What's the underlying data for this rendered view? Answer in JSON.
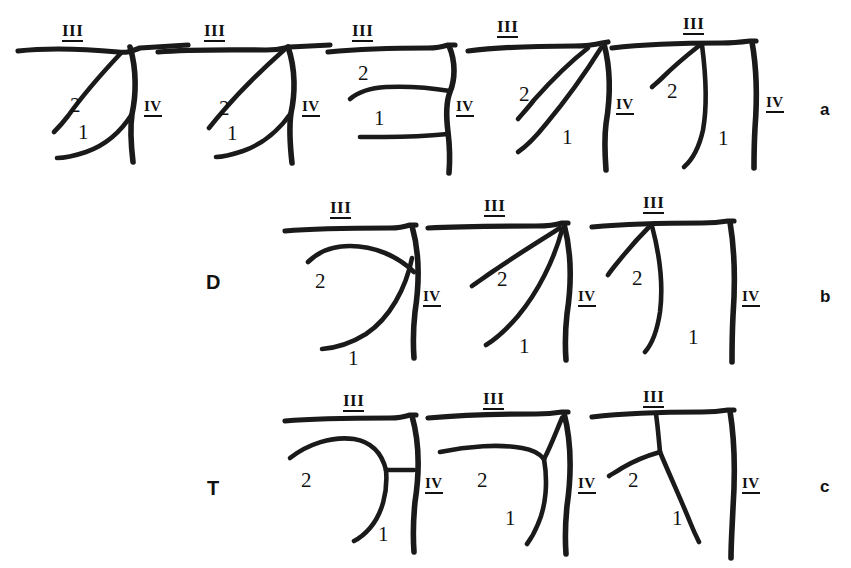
{
  "figure": {
    "caption_present": false,
    "background_color": "#ffffff",
    "ink_color": "#1a1a1a",
    "rows": [
      {
        "id": "row-a",
        "row_letter": "a",
        "group_label": "",
        "panel_count": 5,
        "panels": [
          {
            "id": "a1",
            "labels": {
              "top_vein": "III",
              "side_vein": "IV",
              "branch_upper": "2",
              "branch_lower": "1"
            }
          },
          {
            "id": "a2",
            "labels": {
              "top_vein": "III",
              "side_vein": "IV",
              "branch_upper": "2",
              "branch_lower": "1"
            }
          },
          {
            "id": "a3",
            "labels": {
              "top_vein": "III",
              "side_vein": "IV",
              "branch_upper": "2",
              "branch_lower": "1"
            }
          },
          {
            "id": "a4",
            "labels": {
              "top_vein": "III",
              "side_vein": "IV",
              "branch_upper": "2",
              "branch_lower": "1"
            }
          },
          {
            "id": "a5",
            "labels": {
              "top_vein": "III",
              "side_vein": "IV",
              "branch_upper": "2",
              "branch_lower": "1"
            }
          }
        ]
      },
      {
        "id": "row-b",
        "row_letter": "b",
        "group_label": "D",
        "panel_count": 3,
        "panels": [
          {
            "id": "b1",
            "labels": {
              "top_vein": "III",
              "side_vein": "IV",
              "branch_upper": "2",
              "branch_lower": "1"
            }
          },
          {
            "id": "b2",
            "labels": {
              "top_vein": "III",
              "side_vein": "IV",
              "branch_upper": "2",
              "branch_lower": "1"
            }
          },
          {
            "id": "b3",
            "labels": {
              "top_vein": "III",
              "side_vein": "IV",
              "branch_upper": "2",
              "branch_lower": "1"
            }
          }
        ]
      },
      {
        "id": "row-c",
        "row_letter": "c",
        "group_label": "T",
        "panel_count": 3,
        "panels": [
          {
            "id": "c1",
            "labels": {
              "top_vein": "III",
              "side_vein": "IV",
              "branch_upper": "2",
              "branch_lower": "1"
            }
          },
          {
            "id": "c2",
            "labels": {
              "top_vein": "III",
              "side_vein": "IV",
              "branch_upper": "2",
              "branch_lower": "1"
            }
          },
          {
            "id": "c3",
            "labels": {
              "top_vein": "III",
              "side_vein": "IV",
              "branch_upper": "2",
              "branch_lower": "1"
            }
          }
        ]
      }
    ]
  },
  "labels": {
    "roman_three": "III",
    "roman_four": "IV",
    "num_one": "1",
    "num_two": "2",
    "group_d": "D",
    "group_t": "T",
    "letter_a": "a",
    "letter_b": "b",
    "letter_c": "c"
  }
}
